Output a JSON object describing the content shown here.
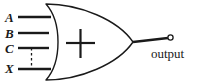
{
  "diagram": {
    "type": "logic-gate-schematic",
    "gate": {
      "name": "xor-parity-gate",
      "body_symbol": "+",
      "shape": "or-gate-curved-back"
    },
    "colors": {
      "stroke": "#1a1a1a",
      "background": "#ffffff",
      "fill": "#ffffff"
    },
    "inputs": [
      {
        "label": "A",
        "style": "solid"
      },
      {
        "label": "B",
        "style": "solid"
      },
      {
        "label": "C",
        "style": "solid"
      },
      {
        "label": "X",
        "style": "solid"
      }
    ],
    "connections": [
      {
        "name": "dashed-link-c-to-x",
        "from": "C",
        "to": "X",
        "style": "dashed"
      }
    ],
    "output": {
      "label": "output",
      "terminal": "open-circle"
    }
  }
}
